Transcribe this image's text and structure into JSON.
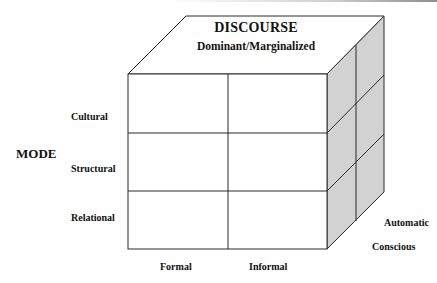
{
  "diagram": {
    "type": "3d-cube-matrix",
    "top_face": {
      "title": "DISCOURSE",
      "subtitle": "Dominant/Marginalized"
    },
    "vertical_axis": {
      "label": "MODE",
      "rows": [
        "Cultural",
        "Structural",
        "Relational"
      ]
    },
    "horizontal_axis": {
      "columns": [
        "Formal",
        "Informal"
      ]
    },
    "depth_axis": {
      "layers": [
        "Automatic",
        "Conscious"
      ]
    },
    "colors": {
      "front_face": "#ffffff",
      "top_face": "#ffffff",
      "side_face": "#d2d2d2",
      "stroke": "#2a2a2a"
    }
  }
}
